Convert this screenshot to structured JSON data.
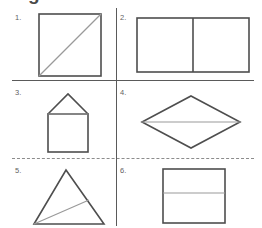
{
  "worksheet": {
    "title": "Figures",
    "background_color": "#ffffff",
    "outline_color": "#4e4e4e",
    "inner_line_color": "#9a9a9a",
    "divider_color": "#5a5a5a",
    "dashed_divider_color": "#8c8c8c",
    "number_color": "#5f5f5f"
  },
  "dividers": [
    {
      "name": "divider-row-1",
      "style": "solid"
    },
    {
      "name": "divider-row-2",
      "style": "dashed"
    },
    {
      "name": "divider-column",
      "style": "solid"
    }
  ],
  "cells": [
    {
      "number": "1.",
      "shape": "square-with-diagonal",
      "description": "Square divided by one diagonal from bottom-left to top-right"
    },
    {
      "number": "2.",
      "shape": "rectangle-with-vertical-line",
      "description": "Rectangle divided by a vertical line into two halves"
    },
    {
      "number": "3.",
      "shape": "house-pentagon",
      "description": "Square with a triangular roof on top"
    },
    {
      "number": "4.",
      "shape": "rhombus-with-horizontal-line",
      "description": "Rhombus divided by a horizontal line through the middle"
    },
    {
      "number": "5.",
      "shape": "triangle-with-cevian",
      "description": "Triangle with a line from the bottom-left vertex to the right side"
    },
    {
      "number": "6.",
      "shape": "square-with-horizontal-line",
      "description": "Square divided by a horizontal line into two parts"
    }
  ]
}
